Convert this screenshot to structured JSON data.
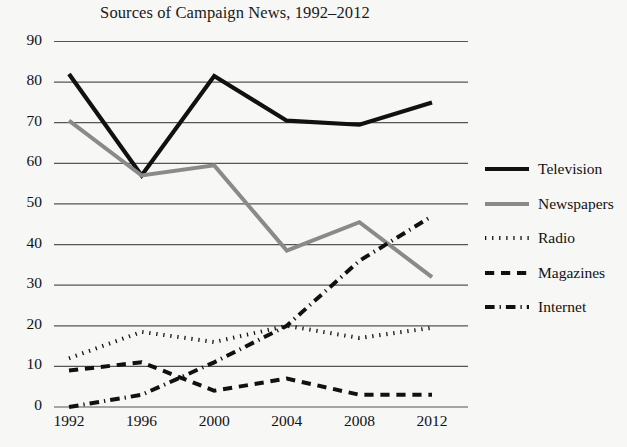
{
  "chart_data": {
    "type": "line",
    "title": "Sources of Campaign News, 1992–2012",
    "xlabel": "",
    "ylabel": "",
    "categories": [
      "1992",
      "1996",
      "2000",
      "2004",
      "2008",
      "2012"
    ],
    "x": [
      1992,
      1996,
      2000,
      2004,
      2008,
      2012
    ],
    "xlim": [
      1992,
      2012
    ],
    "ylim": [
      0,
      90
    ],
    "yticks": [
      0,
      10,
      20,
      30,
      40,
      50,
      60,
      70,
      80,
      90
    ],
    "ytick_labels": [
      "0",
      "10",
      "20",
      "30",
      "40",
      "50",
      "60",
      "70",
      "80",
      "90"
    ],
    "grid": "horizontal",
    "legend_position": "right",
    "series": [
      {
        "name": "Television",
        "style": "solid",
        "color": "#111111",
        "width": 4.2,
        "values": [
          82,
          57,
          81.5,
          70.5,
          69.5,
          75
        ]
      },
      {
        "name": "Newspapers",
        "style": "solid",
        "color": "#8a8a8a",
        "width": 4.0,
        "values": [
          70.5,
          57,
          59.5,
          38.5,
          45.5,
          32
        ]
      },
      {
        "name": "Radio",
        "style": "dotted",
        "color": "#111111",
        "width": 4.0,
        "values": [
          12,
          18.5,
          16,
          20,
          17,
          19.5
        ]
      },
      {
        "name": "Magazines",
        "style": "dashed",
        "color": "#111111",
        "width": 4.0,
        "values": [
          9,
          11,
          4,
          7,
          3,
          3
        ]
      },
      {
        "name": "Internet",
        "style": "dashdot",
        "color": "#111111",
        "width": 4.0,
        "values": [
          0,
          3,
          11,
          20,
          36,
          47
        ]
      }
    ]
  },
  "legend": {
    "items": [
      {
        "label": "Television"
      },
      {
        "label": "Newspapers"
      },
      {
        "label": "Radio"
      },
      {
        "label": "Magazines"
      },
      {
        "label": "Internet"
      }
    ]
  }
}
